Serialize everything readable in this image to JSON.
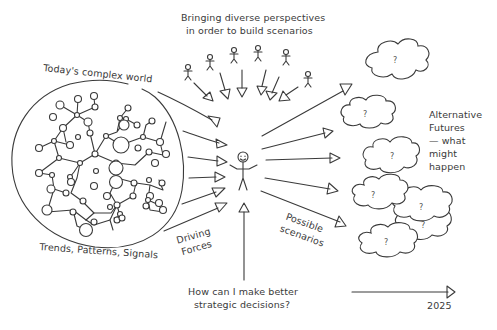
{
  "diagram": {
    "title_line1": "Bringing diverse perspectives",
    "title_line2": "in order to build scenarios",
    "world_label": "Today's complex world",
    "trends_label": "Trends, Patterns, Signals",
    "driving_forces_line1": "Driving",
    "driving_forces_line2": "Forces",
    "possible_scenarios_line1": "Possible",
    "possible_scenarios_line2": "scenarios",
    "alternative_futures": [
      "Alternative",
      "Futures",
      "— what",
      "might",
      "happen"
    ],
    "question_line1": "How can I make better",
    "question_line2": "strategic decisions?",
    "timeline_year": "2025",
    "cloud_mark": "?",
    "stakeholder_count": 6,
    "scenario_cloud_count": 6
  },
  "colors": {
    "ink": "#3a3a3a",
    "background": "#ffffff"
  }
}
